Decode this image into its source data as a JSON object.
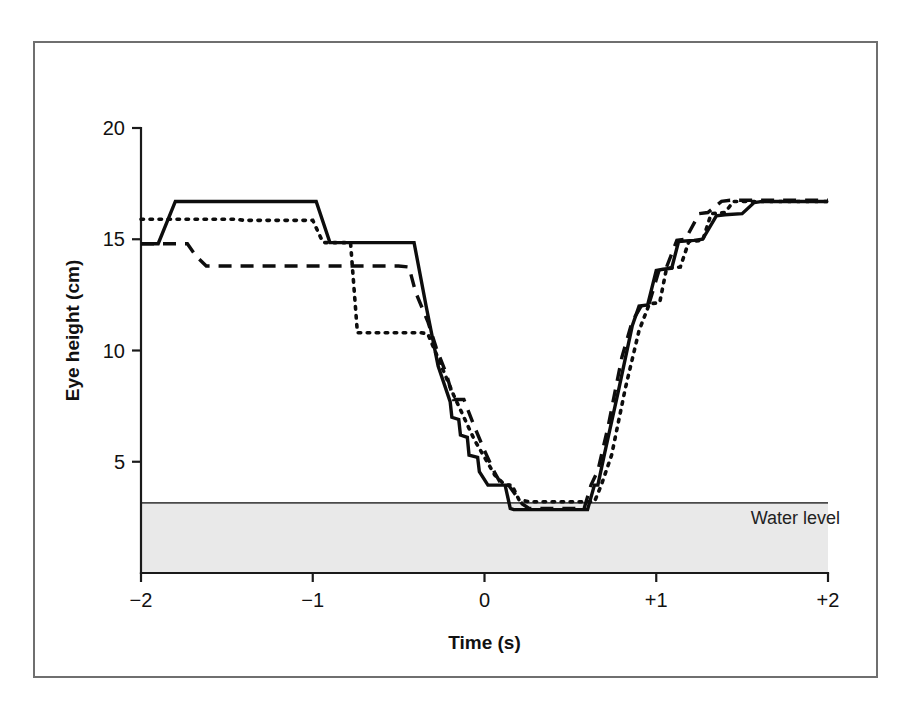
{
  "figure": {
    "background_color": "#ffffff",
    "frame_color": "#6f6f6f",
    "ink_color": "#0d0d0d",
    "water_fill_color": "#e9e9e9"
  },
  "chart_data": {
    "type": "line",
    "title": "",
    "subtitle": "",
    "xlabel": "Time (s)",
    "ylabel": "Eye height (cm)",
    "xlim": [
      -2,
      2
    ],
    "ylim": [
      0,
      20
    ],
    "xticks": [
      -2,
      -1,
      0,
      1,
      2
    ],
    "xtick_labels": [
      "−2",
      "−1",
      "0",
      "+1",
      "+2"
    ],
    "yticks": [
      5,
      10,
      15,
      20
    ],
    "ytick_labels": [
      "5",
      "10",
      "15",
      "20"
    ],
    "grid": false,
    "legend": "none",
    "annotations": [
      {
        "name": "water-level-label",
        "text": "Water level",
        "x": 1.55,
        "y": 2.2
      }
    ],
    "shaded_regions": [
      {
        "name": "water-band",
        "label": "Water level",
        "from_y": 0.0,
        "to_y": 3.15,
        "fill": "#e9e9e9"
      }
    ],
    "series": [
      {
        "name": "trial-1",
        "style": "solid",
        "x": [
          -2.0,
          -1.9,
          -1.8,
          -1.72,
          -0.98,
          -0.9,
          -0.41,
          -0.34,
          -0.27,
          -0.2,
          -0.19,
          -0.15,
          -0.14,
          -0.1,
          -0.09,
          -0.04,
          -0.03,
          0.02,
          0.12,
          0.15,
          0.17,
          0.6,
          0.64,
          0.66,
          0.7,
          0.78,
          0.86,
          0.9,
          0.95,
          1.0,
          1.04,
          1.09,
          1.13,
          1.22,
          1.27,
          1.35,
          1.4,
          1.5,
          1.57,
          1.62,
          1.66,
          2.0
        ],
        "y": [
          14.8,
          14.8,
          16.7,
          16.7,
          16.7,
          14.85,
          14.85,
          12.0,
          9.3,
          7.7,
          7.0,
          6.9,
          6.2,
          6.1,
          5.3,
          5.2,
          4.55,
          3.95,
          3.95,
          2.9,
          2.85,
          2.85,
          3.95,
          3.95,
          5.4,
          8.2,
          11.1,
          12.0,
          12.05,
          13.6,
          13.65,
          13.7,
          14.9,
          14.95,
          15.0,
          16.05,
          16.1,
          16.15,
          16.65,
          16.7,
          16.7,
          16.7
        ]
      },
      {
        "name": "trial-2",
        "style": "dashed",
        "x": [
          -2.0,
          -1.73,
          -1.68,
          -1.62,
          -0.5,
          -0.44,
          -0.4,
          -0.33,
          -0.28,
          -0.22,
          -0.18,
          -0.12,
          -0.06,
          0.0,
          0.06,
          0.1,
          0.14,
          0.22,
          0.26,
          0.58,
          0.62,
          0.66,
          0.72,
          0.8,
          0.86,
          0.92,
          0.96,
          1.02,
          1.06,
          1.12,
          1.17,
          1.25,
          1.3,
          1.38,
          1.43,
          2.0
        ],
        "y": [
          14.8,
          14.8,
          14.25,
          13.8,
          13.8,
          13.75,
          12.6,
          11.3,
          10.1,
          8.9,
          7.8,
          7.8,
          6.6,
          5.5,
          4.5,
          3.95,
          3.95,
          3.1,
          2.9,
          2.9,
          3.95,
          4.6,
          6.6,
          9.7,
          11.3,
          12.1,
          12.15,
          13.7,
          13.75,
          14.95,
          15.0,
          16.15,
          16.2,
          16.7,
          16.75,
          16.75
        ]
      },
      {
        "name": "trial-3",
        "style": "dotted",
        "x": [
          -2.0,
          -1.85,
          -1.45,
          -1.4,
          -1.0,
          -0.94,
          -0.78,
          -0.74,
          -0.37,
          -0.33,
          -0.24,
          -0.18,
          -0.12,
          -0.06,
          0.0,
          0.06,
          0.12,
          0.16,
          0.2,
          0.26,
          0.3,
          0.64,
          0.68,
          0.74,
          0.82,
          0.9,
          0.96,
          1.02,
          1.06,
          1.14,
          1.19,
          1.27,
          1.32,
          1.4,
          1.45,
          2.0
        ],
        "y": [
          15.9,
          15.9,
          15.9,
          15.85,
          15.85,
          14.85,
          14.85,
          10.8,
          10.8,
          10.75,
          9.1,
          8.0,
          7.0,
          6.0,
          5.2,
          4.4,
          3.95,
          3.95,
          3.3,
          3.2,
          3.2,
          3.2,
          3.95,
          5.3,
          8.3,
          10.9,
          12.1,
          12.15,
          13.7,
          13.75,
          14.9,
          14.95,
          16.15,
          16.2,
          16.7,
          16.7
        ]
      }
    ]
  }
}
